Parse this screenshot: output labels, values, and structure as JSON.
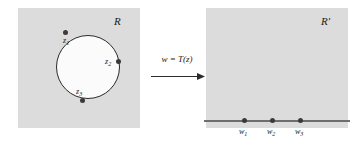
{
  "figure": {
    "background_color": "#ffffff",
    "panel_color": "#dcdcdc"
  },
  "left_panel": {
    "region_label": "R",
    "shape": "circle",
    "shape_fill": "#fbfbfb",
    "shape_stroke": "#2b2b2b",
    "points": [
      {
        "name": "z1",
        "label_base": "z",
        "label_sub": "1"
      },
      {
        "name": "z2",
        "label_base": "z",
        "label_sub": "2"
      },
      {
        "name": "z3",
        "label_base": "z",
        "label_sub": "3"
      }
    ]
  },
  "transform": {
    "formula": "w = T(z)",
    "arrow": "right-arrow",
    "arrow_color": "#2b2b2b"
  },
  "right_panel": {
    "region_label": "R′",
    "axis_color": "#6e6e6e",
    "points": [
      {
        "name": "w1",
        "label_base": "w",
        "label_sub": "1"
      },
      {
        "name": "w2",
        "label_base": "w",
        "label_sub": "2"
      },
      {
        "name": "w3",
        "label_base": "w",
        "label_sub": "3"
      }
    ]
  },
  "marker_color": "#3a3a3a"
}
